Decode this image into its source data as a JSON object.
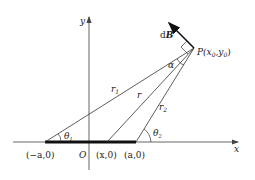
{
  "diagram": {
    "axes": {
      "x_label": "x",
      "y_label": "y",
      "origin_label": "O"
    },
    "points": {
      "P_label": "P(x",
      "P_sub0": "0",
      "P_mid": ",y",
      "P_sub1": "0",
      "P_end": ")",
      "left_end": "(−a,0)",
      "right_end": "(a,0)",
      "source": "(x,0)"
    },
    "vector": {
      "d": "d",
      "B": "B"
    },
    "segments": {
      "r1": "r",
      "r1_sub": "1",
      "r": "r",
      "r2": "r",
      "r2_sub": "2"
    },
    "angles": {
      "theta1": "θ",
      "theta1_sub": "1",
      "theta2": "θ",
      "theta2_sub": "2",
      "alpha": "α"
    },
    "colors": {
      "line": "#333333",
      "axis": "#555555",
      "bar": "#111111"
    }
  }
}
